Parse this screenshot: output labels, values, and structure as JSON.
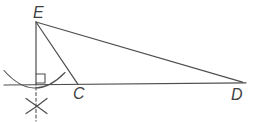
{
  "diagram": {
    "kind": "geometry-perpendicular-construction",
    "vertices": {
      "E": "E",
      "C": "C",
      "D": "D"
    },
    "colors": {
      "stroke": "#4e4e4e",
      "label": "#3f3f3f",
      "background": "#ffffff"
    },
    "marks": {
      "right_angle": "right-angle-square",
      "compass_arc": "arc-crossing-baseline",
      "cross_below": "arc-intersection-x",
      "dashed": "dashed-construction-line"
    }
  }
}
